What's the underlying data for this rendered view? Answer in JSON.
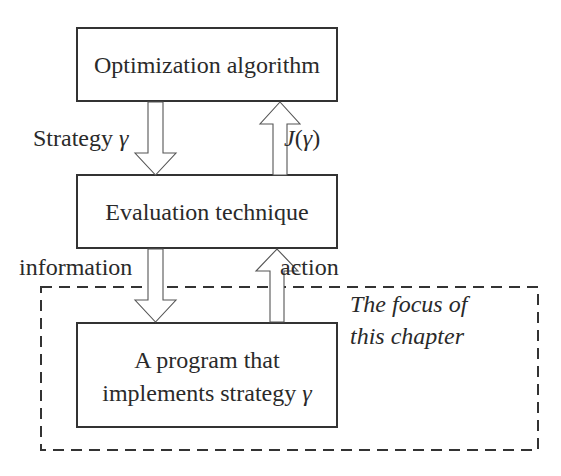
{
  "diagram": {
    "nodes": [
      {
        "id": "optimization",
        "label": "Optimization algorithm"
      },
      {
        "id": "evaluation",
        "label": "Evaluation technique"
      },
      {
        "id": "program",
        "label_line1": "A program that",
        "label_line2_text": "implements strategy ",
        "label_line2_symbol": "γ"
      }
    ],
    "edges": [
      {
        "from": "optimization",
        "to": "evaluation",
        "label_text": "Strategy ",
        "label_symbol": "γ"
      },
      {
        "from": "evaluation",
        "to": "optimization",
        "label_J": "J",
        "label_open": "(",
        "label_symbol": "γ",
        "label_close": ")"
      },
      {
        "from": "evaluation",
        "to": "program",
        "label": "information"
      },
      {
        "from": "program",
        "to": "evaluation",
        "label": "action"
      }
    ],
    "focus_region": {
      "line1": "The focus of",
      "line2": "this chapter"
    }
  },
  "colors": {
    "stroke": "#333333",
    "arrow_stroke": "#555555",
    "text": "#2a2a2a",
    "background": "#ffffff"
  }
}
